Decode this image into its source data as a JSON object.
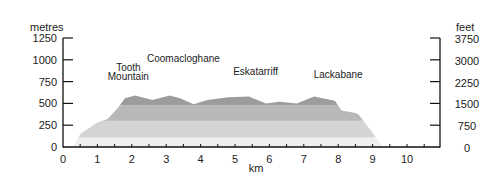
{
  "chart_data": {
    "type": "area",
    "title": "",
    "xlabel": "km",
    "ylabel": "metres",
    "ylabel_right": "feet",
    "xlim": [
      0,
      10.9
    ],
    "ylim": [
      0,
      1250
    ],
    "x_ticks": [
      0,
      1,
      2,
      3,
      4,
      5,
      6,
      7,
      8,
      9,
      10
    ],
    "x_minor_step": 0.5,
    "y_ticks_left": [
      0,
      250,
      500,
      750,
      1000,
      1250
    ],
    "y_ticks_right": [
      0,
      750,
      1500,
      2250,
      3000,
      3750
    ],
    "grid": false,
    "bands_m": [
      0,
      110,
      300,
      480,
      700
    ],
    "band_colors": [
      "#efefef",
      "#d4d4d4",
      "#b8b8b8",
      "#9c9c9c"
    ],
    "series": [
      {
        "name": "elevation profile",
        "x": [
          0.3,
          0.5,
          1.0,
          1.3,
          1.6,
          1.8,
          2.1,
          2.6,
          3.1,
          3.4,
          3.8,
          4.2,
          4.8,
          5.4,
          5.9,
          6.3,
          6.8,
          7.3,
          7.9,
          8.1,
          8.5,
          8.6,
          9.0,
          9.3
        ],
        "values": [
          0,
          150,
          280,
          320,
          450,
          560,
          590,
          540,
          590,
          560,
          490,
          540,
          570,
          580,
          500,
          520,
          500,
          580,
          530,
          420,
          390,
          370,
          160,
          0
        ]
      }
    ],
    "annotations": [
      {
        "text": "Tooth",
        "x": 1.9,
        "y": 870
      },
      {
        "text": "Mountain",
        "x": 1.9,
        "y": 770
      },
      {
        "text": "Coomacloghane",
        "x": 3.5,
        "y": 980
      },
      {
        "text": "Eskatarriff",
        "x": 5.6,
        "y": 820
      },
      {
        "text": "Lackabane",
        "x": 8.0,
        "y": 790
      }
    ]
  }
}
